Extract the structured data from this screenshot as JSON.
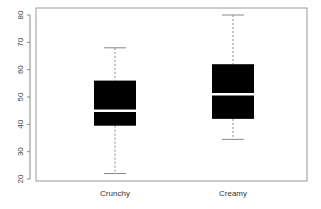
{
  "chart_data": {
    "type": "box",
    "title": "",
    "xlabel": "",
    "ylabel": "",
    "categories": [
      "Crunchy",
      "Creamy"
    ],
    "ylim": [
      20,
      80
    ],
    "yticks": [
      20,
      30,
      40,
      50,
      60,
      70,
      80
    ],
    "series": [
      {
        "name": "Crunchy",
        "whisker_low": 22,
        "q1": 39.5,
        "median": 45,
        "q3": 56,
        "whisker_high": 68
      },
      {
        "name": "Creamy",
        "whisker_low": 34.5,
        "q1": 42,
        "median": 51,
        "q3": 62,
        "whisker_high": 80
      }
    ],
    "grid": false,
    "legend": null,
    "colors": {
      "box_fill": "#000000",
      "median": "#ffffff",
      "whisker": "#888888",
      "frame": "#999999"
    }
  }
}
